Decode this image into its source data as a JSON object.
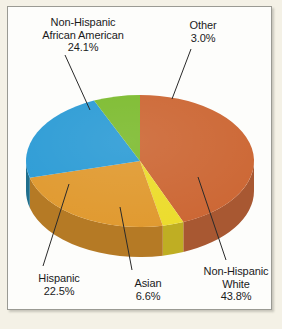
{
  "figure": {
    "background_color": "#f4f1e6",
    "panel_color": "#fdfdfb",
    "border_color": "#9a9a93"
  },
  "chart_data": {
    "type": "pie",
    "title": "",
    "subtitle": "",
    "three_d": true,
    "legend_position": "none",
    "labels_style": "outside-with-leader-lines",
    "categories": [
      "Non-Hispanic White",
      "Other",
      "Non-Hispanic African American",
      "Hispanic",
      "Asian"
    ],
    "values": [
      43.8,
      3.0,
      24.1,
      22.5,
      6.6
    ],
    "value_suffix": "%",
    "colors": [
      "#cc6633",
      "#ecdc2b",
      "#e0992e",
      "#2b9bd5",
      "#7cbb2e"
    ],
    "side_colors": [
      "#a85832",
      "#bfae23",
      "#b57a25",
      "#1f6e8c",
      "#5f9426"
    ],
    "slices": [
      {
        "name": "Non-Hispanic White",
        "label_line1": "Non-Hispanic",
        "label_line2": "White",
        "value_text": "43.8%",
        "value": 43.8,
        "top_color": "#cc6633",
        "side_color": "#a85832"
      },
      {
        "name": "Other",
        "label_line1": "Other",
        "label_line2": "",
        "value_text": "3.0%",
        "value": 3.0,
        "top_color": "#ecdc2b",
        "side_color": "#bfae23"
      },
      {
        "name": "Non-Hispanic African American",
        "label_line1": "Non-Hispanic",
        "label_line2": "African American",
        "value_text": "24.1%",
        "value": 24.1,
        "top_color": "#e0992e",
        "side_color": "#b57a25"
      },
      {
        "name": "Hispanic",
        "label_line1": "Hispanic",
        "label_line2": "",
        "value_text": "22.5%",
        "value": 22.5,
        "top_color": "#2b9bd5",
        "side_color": "#1f6e8c"
      },
      {
        "name": "Asian",
        "label_line1": "Asian",
        "label_line2": "",
        "value_text": "6.6%",
        "value": 6.6,
        "top_color": "#7cbb2e",
        "side_color": "#5f9426"
      }
    ]
  }
}
